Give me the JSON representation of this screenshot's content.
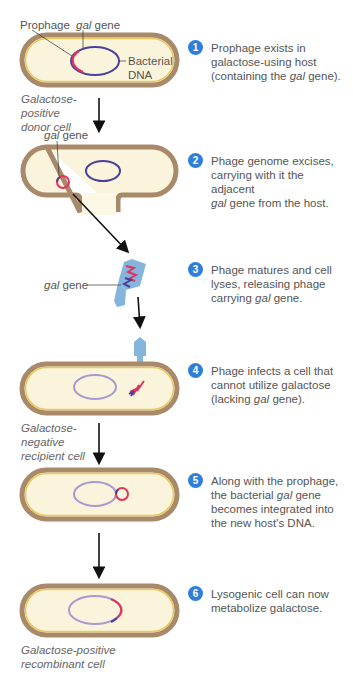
{
  "colors": {
    "cell_wall": "#a8896a",
    "cell_inner_rim": "#e9c95a",
    "cytoplasm": "#fbf4dc",
    "bacterial_dna_dark": "#4a3f9a",
    "bacterial_dna_light": "#a59bd0",
    "gal_prophage": "#e0345f",
    "phage": "#84b5dc",
    "badge": "#2f7fd8",
    "arrow": "#111111"
  },
  "labels": {
    "prophage": "Prophage",
    "gal_gene_italic": "gal",
    "gene": " gene",
    "bacterial": "Bacterial",
    "dna": "DNA",
    "donor_caption": [
      "Galactose-",
      "positive",
      "donor cell"
    ],
    "recipient_caption": [
      "Galactose-",
      "negative",
      "recipient cell"
    ],
    "recombinant_caption": [
      "Galactose-positive",
      "recombinant cell"
    ]
  },
  "steps": [
    {
      "num": "1",
      "lines": [
        "Prophage exists in",
        "galactose-using host",
        "(containing the ",
        "gal",
        " gene)."
      ]
    },
    {
      "num": "2",
      "lines": [
        "Phage genome excises,",
        "carrying with it the adjacent",
        "gal",
        " gene from the host."
      ]
    },
    {
      "num": "3",
      "lines": [
        "Phage matures and cell",
        "lyses, releasing phage",
        "carrying ",
        "gal",
        " gene."
      ]
    },
    {
      "num": "4",
      "lines": [
        "Phage infects a cell that",
        "cannot utilize galactose",
        "(lacking ",
        "gal",
        " gene)."
      ]
    },
    {
      "num": "5",
      "lines": [
        "Along with the prophage,",
        "the bacterial ",
        "gal",
        " gene",
        "becomes integrated into",
        "the new host's DNA."
      ]
    },
    {
      "num": "6",
      "lines": [
        "Lysogenic cell can now",
        "metabolize galactose."
      ]
    }
  ]
}
